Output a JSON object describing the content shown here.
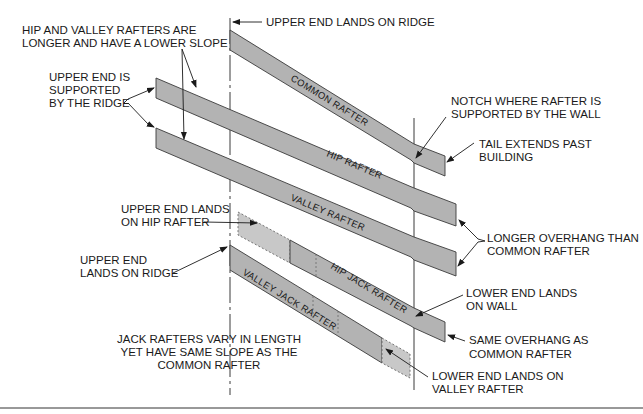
{
  "diagram": {
    "rafters": [
      {
        "id": "common",
        "label": "COMMON RAFTER"
      },
      {
        "id": "hip",
        "label": "HIP RAFTER"
      },
      {
        "id": "valley",
        "label": "VALLEY RAFTER"
      },
      {
        "id": "hip_jack",
        "label": "HIP JACK RAFTER"
      },
      {
        "id": "valley_jack",
        "label": "VALLEY JACK RAFTER"
      }
    ],
    "callouts": {
      "upper_end_ridge": "UPPER END LANDS ON RIDGE",
      "hip_valley_longer": [
        "HIP AND VALLEY RAFTERS ARE",
        "LONGER AND HAVE A LOWER SLOPE"
      ],
      "upper_end_supported": [
        "UPPER END IS",
        "SUPPORTED",
        "BY THE RIDGE"
      ],
      "notch": [
        "NOTCH WHERE RAFTER IS",
        "SUPPORTED BY THE WALL"
      ],
      "tail": [
        "TAIL EXTENDS PAST",
        "BUILDING"
      ],
      "upper_end_hip": [
        "UPPER END LANDS",
        "ON HIP RAFTER"
      ],
      "longer_overhang": [
        "LONGER OVERHANG THAN",
        "COMMON RAFTER"
      ],
      "upper_end_ridge_2": [
        "UPPER END",
        "LANDS ON RIDGE"
      ],
      "lower_end_wall": [
        "LOWER END LANDS",
        "ON WALL"
      ],
      "same_overhang": [
        "SAME OVERHANG AS",
        "COMMON RAFTER"
      ],
      "jack_vary": [
        "JACK RAFTERS VARY IN LENGTH",
        "YET HAVE SAME SLOPE AS THE",
        "COMMON RAFTER"
      ],
      "lower_end_valley": [
        "LOWER END LANDS ON",
        "VALLEY RAFTER"
      ]
    }
  }
}
